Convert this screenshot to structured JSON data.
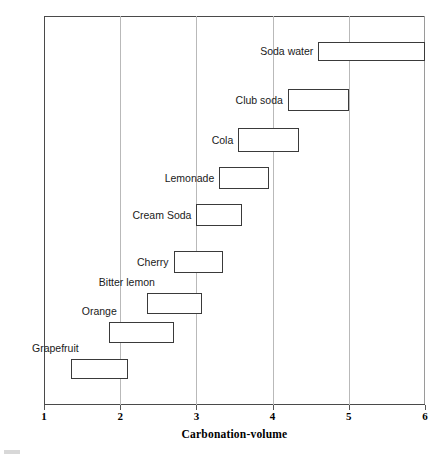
{
  "chart_data": {
    "type": "bar",
    "subtype": "floating-horizontal-range-bar",
    "title": "",
    "xlabel": "Carbonation-volume",
    "ylabel": "Name of Product",
    "xlim": [
      1,
      6
    ],
    "xticks": [
      1,
      2,
      3,
      4,
      5,
      6
    ],
    "xtick_labels": [
      "1",
      "2",
      "3",
      "4",
      "5",
      "6"
    ],
    "grid": "vertical-only",
    "legend": "none",
    "categories": [
      "Soda water",
      "Club soda",
      "Cola",
      "Lemonade",
      "Cream Soda",
      "Cherry",
      "Bitter lemon",
      "Orange",
      "Grapefruit"
    ],
    "ranges": [
      {
        "name": "Soda water",
        "low": 4.6,
        "high": 6.0
      },
      {
        "name": "Club soda",
        "low": 4.2,
        "high": 5.0
      },
      {
        "name": "Cola",
        "low": 3.55,
        "high": 4.35
      },
      {
        "name": "Lemonade",
        "low": 3.3,
        "high": 3.95
      },
      {
        "name": "Cream Soda",
        "low": 3.0,
        "high": 3.6
      },
      {
        "name": "Cherry",
        "low": 2.7,
        "high": 3.35
      },
      {
        "name": "Bitter lemon",
        "low": 2.35,
        "high": 3.08
      },
      {
        "name": "Orange",
        "low": 1.85,
        "high": 2.7
      },
      {
        "name": "Grapefruit",
        "low": 1.35,
        "high": 2.1
      }
    ],
    "bar_edge_color": "#3a3a3a",
    "bar_fill_color": "#ffffff",
    "gridline_color": "#b9b9b9",
    "axis_color": "#4a4a4a"
  },
  "bar_rows": [
    {
      "label": "Soda water",
      "low": 4.6,
      "high": 6.0,
      "top": 42,
      "height": 19,
      "label_above": false
    },
    {
      "label": "Club soda",
      "low": 4.2,
      "high": 5.0,
      "top": 89,
      "height": 22,
      "label_above": false
    },
    {
      "label": "Cola",
      "low": 3.55,
      "high": 4.35,
      "top": 128,
      "height": 24,
      "label_above": false
    },
    {
      "label": "Lemonade",
      "low": 3.3,
      "high": 3.95,
      "top": 167,
      "height": 22,
      "label_above": false
    },
    {
      "label": "Cream Soda",
      "low": 3.0,
      "high": 3.6,
      "top": 204,
      "height": 22,
      "label_above": false
    },
    {
      "label": "Cherry",
      "low": 2.7,
      "high": 3.35,
      "top": 251,
      "height": 22,
      "label_above": false
    },
    {
      "label": "Bitter lemon",
      "low": 2.35,
      "high": 3.08,
      "top": 293,
      "height": 21,
      "label_above": true
    },
    {
      "label": "Orange",
      "low": 1.85,
      "high": 2.7,
      "top": 322,
      "height": 21,
      "label_above": true
    },
    {
      "label": "Grapefruit",
      "low": 1.35,
      "high": 2.1,
      "top": 359,
      "height": 20,
      "label_above": true
    }
  ]
}
